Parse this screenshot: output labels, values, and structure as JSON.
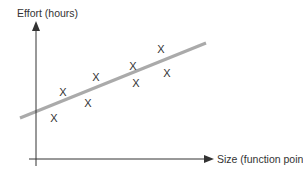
{
  "chart_data": {
    "type": "scatter",
    "title": "",
    "xlabel": "Size (function points)",
    "ylabel": "Effort (hours)",
    "grid": false,
    "legend": null,
    "ticks": {
      "x": [],
      "y": []
    },
    "marker": "X",
    "trend_line": {
      "type": "linear",
      "color": "#aaaaaa",
      "from_px": [
        20,
        118
      ],
      "to_px": [
        206,
        43
      ]
    },
    "points_px": [
      {
        "x": 54,
        "y": 118
      },
      {
        "x": 63,
        "y": 92
      },
      {
        "x": 88,
        "y": 103
      },
      {
        "x": 96,
        "y": 77
      },
      {
        "x": 133,
        "y": 66
      },
      {
        "x": 136,
        "y": 83
      },
      {
        "x": 161,
        "y": 49
      },
      {
        "x": 167,
        "y": 73
      }
    ],
    "colors": {
      "axis": "#333333",
      "text": "#333333",
      "trend": "#aaaaaa"
    }
  },
  "labels": {
    "y_axis": "Effort (hours)",
    "x_axis": "Size (function points)",
    "marker_glyph": "X"
  }
}
